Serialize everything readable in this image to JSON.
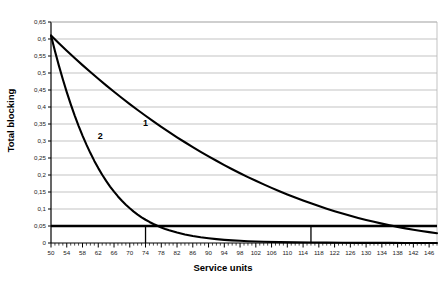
{
  "chart_data": {
    "type": "line",
    "title": "",
    "xlabel": "Service units",
    "ylabel": "Total blocking",
    "xlim": [
      50,
      148
    ],
    "ylim": [
      0,
      0.65
    ],
    "grid": "horizontal",
    "legend": "inline-labels",
    "decimal_separator": ",",
    "x_ticks": [
      50,
      54,
      58,
      62,
      66,
      70,
      74,
      78,
      82,
      86,
      90,
      94,
      98,
      102,
      106,
      110,
      114,
      118,
      122,
      126,
      130,
      134,
      138,
      142,
      146
    ],
    "x_tick_labels": [
      "50",
      "54",
      "58",
      "62",
      "66",
      "70",
      "74",
      "78",
      "82",
      "86",
      "90",
      "94",
      "98",
      "102",
      "106",
      "110",
      "114",
      "118",
      "122",
      "126",
      "130",
      "134",
      "138",
      "142",
      "146"
    ],
    "x_minor_step": 1,
    "y_ticks": [
      0,
      0.05,
      0.1,
      0.15,
      0.2,
      0.25,
      0.3,
      0.35,
      0.4,
      0.45,
      0.5,
      0.55,
      0.6,
      0.65
    ],
    "y_tick_labels": [
      "0",
      "0,05",
      "0,1",
      "0,15",
      "0,2",
      "0,25",
      "0,3",
      "0,35",
      "0,4",
      "0,45",
      "0,5",
      "0,55",
      "0,6",
      "0,65"
    ],
    "series": [
      {
        "name": "1",
        "label": "1",
        "label_x": 74,
        "label_y": 0.345,
        "color": "#000000",
        "line_width": 2.1,
        "x": [
          50,
          52,
          54,
          56,
          58,
          60,
          62,
          64,
          66,
          68,
          70,
          72,
          74,
          76,
          78,
          80,
          82,
          84,
          86,
          88,
          90,
          92,
          94,
          96,
          98,
          100,
          102,
          104,
          106,
          108,
          110,
          112,
          114,
          116,
          118,
          120,
          122,
          124,
          126,
          128,
          130,
          132,
          134,
          136,
          138,
          140,
          142,
          144,
          146,
          148
        ],
        "y": [
          0.61,
          0.5875,
          0.5655,
          0.5441,
          0.5232,
          0.5028,
          0.483,
          0.4636,
          0.4448,
          0.4264,
          0.4085,
          0.3911,
          0.3742,
          0.3577,
          0.3417,
          0.3261,
          0.311,
          0.2963,
          0.282,
          0.2682,
          0.2548,
          0.2418,
          0.2292,
          0.217,
          0.2053,
          0.1939,
          0.1829,
          0.1723,
          0.1621,
          0.1523,
          0.1428,
          0.1337,
          0.125,
          0.1166,
          0.1086,
          0.101,
          0.0937,
          0.0867,
          0.0801,
          0.0738,
          0.0679,
          0.0623,
          0.057,
          0.0521,
          0.0474,
          0.0431,
          0.0391,
          0.0354,
          0.032,
          0.0289
        ]
      },
      {
        "name": "2",
        "label": "2",
        "label_x": 62.5,
        "label_y": 0.305,
        "color": "#000000",
        "line_width": 2.1,
        "x": [
          50,
          51,
          52,
          53,
          54,
          55,
          56,
          57,
          58,
          59,
          60,
          61,
          62,
          63,
          64,
          65,
          66,
          67,
          68,
          69,
          70,
          71,
          72,
          73,
          74,
          75,
          76,
          77,
          78,
          79,
          80,
          82,
          84,
          86,
          88,
          90,
          92,
          94,
          96,
          98,
          100,
          104,
          108,
          112,
          116,
          120,
          124,
          128,
          132,
          136,
          140,
          144,
          148
        ],
        "y": [
          0.61,
          0.5645,
          0.5217,
          0.4815,
          0.4438,
          0.4085,
          0.3755,
          0.3447,
          0.316,
          0.2893,
          0.2645,
          0.2415,
          0.2203,
          0.2007,
          0.1827,
          0.1661,
          0.1509,
          0.1369,
          0.1242,
          0.1126,
          0.102,
          0.0923,
          0.0836,
          0.0756,
          0.0684,
          0.0619,
          0.056,
          0.0506,
          0.0458,
          0.0414,
          0.0375,
          0.0306,
          0.025,
          0.0205,
          0.0168,
          0.0138,
          0.0113,
          0.0093,
          0.0077,
          0.0064,
          0.0053,
          0.0037,
          0.0026,
          0.0019,
          0.0014,
          0.001,
          0.0007,
          0.0005,
          0.0004,
          0.0003,
          0.0002,
          0.0002,
          0.0001
        ]
      }
    ],
    "annotations": [
      {
        "name": "threshold-line",
        "kind": "horizontal-line",
        "y": 0.05,
        "x_start": 50,
        "x_end": 148,
        "color": "#000000",
        "line_width": 2.4
      },
      {
        "name": "drop-line-series-2",
        "kind": "vertical-line",
        "x": 74,
        "y_start": 0.05,
        "y_end": 0,
        "color": "#000000",
        "line_width": 1.3
      },
      {
        "name": "drop-line-series-1",
        "kind": "vertical-line",
        "x": 116,
        "y_start": 0.05,
        "y_end": 0,
        "color": "#000000",
        "line_width": 1.3
      }
    ],
    "colors": {
      "axis": "#000000",
      "grid": "#b4b4b4",
      "plot_background": "#ffffff",
      "curve": "#000000"
    }
  }
}
